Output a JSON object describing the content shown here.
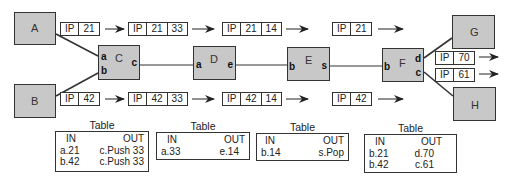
{
  "nodes": {
    "A": {
      "label": "A"
    },
    "B": {
      "label": "B"
    },
    "C": {
      "label": "C",
      "ports": [
        "a",
        "b",
        "c"
      ]
    },
    "D": {
      "label": "D",
      "ports": [
        "a",
        "e"
      ]
    },
    "E": {
      "label": "E",
      "ports": [
        "b",
        "s"
      ]
    },
    "F": {
      "label": "F",
      "ports": [
        "b",
        "d",
        "c"
      ]
    },
    "G": {
      "label": "G"
    },
    "H": {
      "label": "H"
    }
  },
  "packets": {
    "top": [
      [
        "IP",
        "21"
      ],
      [
        "IP",
        "21",
        "33"
      ],
      [
        "IP",
        "21",
        "14"
      ],
      [
        "IP",
        "21"
      ]
    ],
    "bottom": [
      [
        "IP",
        "42"
      ],
      [
        "IP",
        "42",
        "33"
      ],
      [
        "IP",
        "42",
        "14"
      ],
      [
        "IP",
        "42"
      ]
    ],
    "out_d": [
      "IP",
      "70"
    ],
    "out_c": [
      "IP",
      "61"
    ]
  },
  "tables": [
    {
      "title": "Table",
      "header": [
        "IN",
        "OUT"
      ],
      "rows": [
        [
          "a.21",
          "c.Push 33"
        ],
        [
          "b.42",
          "c.Push 33"
        ]
      ]
    },
    {
      "title": "Table",
      "header": [
        "IN",
        "OUT"
      ],
      "rows": [
        [
          "a.33",
          "e.14"
        ]
      ]
    },
    {
      "title": "Table",
      "header": [
        "IN",
        "OUT"
      ],
      "rows": [
        [
          "b.14",
          "s.Pop"
        ]
      ]
    },
    {
      "title": "Table",
      "header": [
        "IN",
        "OUT"
      ],
      "rows": [
        [
          "b.21",
          "d.70"
        ],
        [
          "b.42",
          "c.61"
        ]
      ]
    }
  ]
}
